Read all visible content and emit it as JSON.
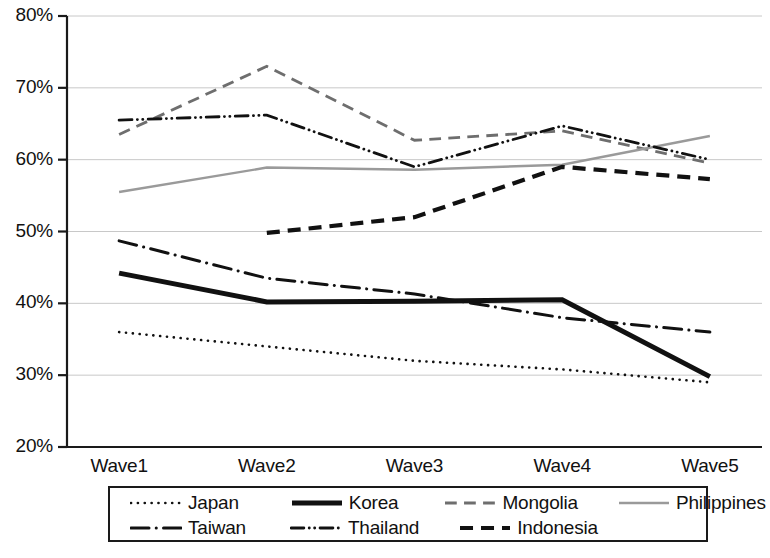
{
  "chart_data": {
    "type": "line",
    "title": "",
    "xlabel": "",
    "ylabel": "",
    "categories": [
      "Wave1",
      "Wave2",
      "Wave3",
      "Wave4",
      "Wave5"
    ],
    "ylim": [
      20,
      80
    ],
    "ytick_labels": [
      "80%",
      "70%",
      "60%",
      "50%",
      "40%",
      "30%",
      "20%"
    ],
    "ytick_values": [
      80,
      70,
      60,
      50,
      40,
      30,
      20
    ],
    "y_unit": "%",
    "grid": "horizontal",
    "legend_position": "bottom",
    "series": [
      {
        "name": "Japan",
        "style": "dotted",
        "color": "#111111",
        "width": 2.6,
        "values": [
          36.0,
          34.0,
          32.0,
          30.8,
          29.0
        ]
      },
      {
        "name": "Korea",
        "style": "solid-thick",
        "color": "#111111",
        "width": 5.0,
        "values": [
          44.2,
          40.2,
          40.3,
          40.5,
          29.8
        ]
      },
      {
        "name": "Mongolia",
        "style": "dashed",
        "color": "#6e6e6e",
        "width": 2.8,
        "values": [
          63.5,
          73.0,
          62.7,
          64.0,
          59.5
        ]
      },
      {
        "name": "Philippines",
        "style": "solid-thin",
        "color": "#9a9a9a",
        "width": 2.4,
        "values": [
          55.5,
          58.9,
          58.6,
          59.3,
          63.3
        ]
      },
      {
        "name": "Taiwan",
        "style": "dash-dot",
        "color": "#111111",
        "width": 3.0,
        "values": [
          48.7,
          43.5,
          41.3,
          38.0,
          36.0
        ]
      },
      {
        "name": "Thailand",
        "style": "dash-dot-dot",
        "color": "#111111",
        "width": 2.8,
        "values": [
          65.5,
          66.2,
          59.0,
          64.7,
          60.0
        ]
      },
      {
        "name": "Indonesia",
        "style": "dashed-thick",
        "color": "#111111",
        "width": 4.2,
        "values": [
          null,
          49.8,
          52.0,
          59.0,
          57.3
        ]
      }
    ]
  },
  "axes": {
    "y_ticks": [
      {
        "label": "80%",
        "value": 80
      },
      {
        "label": "70%",
        "value": 70
      },
      {
        "label": "60%",
        "value": 60
      },
      {
        "label": "50%",
        "value": 50
      },
      {
        "label": "40%",
        "value": 40
      },
      {
        "label": "30%",
        "value": 30
      },
      {
        "label": "20%",
        "value": 20
      }
    ],
    "x_ticks": [
      {
        "label": "Wave1"
      },
      {
        "label": "Wave2"
      },
      {
        "label": "Wave3"
      },
      {
        "label": "Wave4"
      },
      {
        "label": "Wave5"
      }
    ]
  },
  "legend": {
    "rows": [
      [
        {
          "label": "Japan",
          "style": "dotted"
        },
        {
          "label": "Korea",
          "style": "solid-thick"
        },
        {
          "label": "Mongolia",
          "style": "dashed"
        },
        {
          "label": "Philippines",
          "style": "solid-thin"
        }
      ],
      [
        {
          "label": "Taiwan",
          "style": "dash-dot"
        },
        {
          "label": "Thailand",
          "style": "dash-dot-dot"
        },
        {
          "label": "Indonesia",
          "style": "dashed-thick"
        }
      ]
    ]
  }
}
